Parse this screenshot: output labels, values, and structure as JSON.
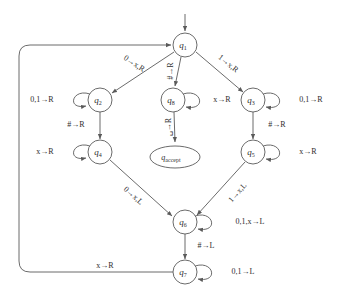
{
  "diagram": {
    "kind": "turing-machine-state-diagram",
    "background_color": "#ffffff",
    "stroke_color": "#5a5a5a",
    "text_color": "#2e2e2e",
    "states": [
      {
        "id": "q1",
        "base": "q",
        "sub": "1",
        "shape": "circle",
        "cx": 185,
        "cy": 45,
        "r": 12
      },
      {
        "id": "q2",
        "base": "q",
        "sub": "2",
        "shape": "circle",
        "cx": 100,
        "cy": 100,
        "r": 12
      },
      {
        "id": "q8",
        "base": "q",
        "sub": "8",
        "shape": "circle",
        "cx": 173,
        "cy": 100,
        "r": 12
      },
      {
        "id": "q3",
        "base": "q",
        "sub": "3",
        "shape": "circle",
        "cx": 253,
        "cy": 100,
        "r": 12
      },
      {
        "id": "q4",
        "base": "q",
        "sub": "4",
        "shape": "circle",
        "cx": 100,
        "cy": 152,
        "r": 12
      },
      {
        "id": "q5",
        "base": "q",
        "sub": "5",
        "shape": "circle",
        "cx": 253,
        "cy": 152,
        "r": 12
      },
      {
        "id": "qaccept",
        "base": "q",
        "sub": "accept",
        "shape": "ellipse",
        "cx": 175,
        "cy": 157,
        "rx": 25,
        "ry": 11
      },
      {
        "id": "q6",
        "base": "q",
        "sub": "6",
        "shape": "circle",
        "cx": 185,
        "cy": 222,
        "r": 12
      },
      {
        "id": "q7",
        "base": "q",
        "sub": "7",
        "shape": "circle",
        "cx": 185,
        "cy": 272,
        "r": 12
      }
    ],
    "start_state": "q1",
    "accept_state": "qaccept",
    "transitions": [
      {
        "from": "start",
        "to": "q1",
        "label": ""
      },
      {
        "from": "q1",
        "to": "q2",
        "label": "0→x,R"
      },
      {
        "from": "q1",
        "to": "q8",
        "label": "#→R"
      },
      {
        "from": "q1",
        "to": "q3",
        "label": "1→x,R"
      },
      {
        "from": "q2",
        "to": "q2",
        "label": "0,1→R"
      },
      {
        "from": "q8",
        "to": "q8",
        "label": "x→R"
      },
      {
        "from": "q3",
        "to": "q3",
        "label": "0,1→R"
      },
      {
        "from": "q8",
        "to": "qaccept",
        "label": "␣→R"
      },
      {
        "from": "q2",
        "to": "q4",
        "label": "#→R"
      },
      {
        "from": "q3",
        "to": "q5",
        "label": "#→R"
      },
      {
        "from": "q4",
        "to": "q4",
        "label": "x→R"
      },
      {
        "from": "q5",
        "to": "q5",
        "label": "x→R"
      },
      {
        "from": "q4",
        "to": "q6",
        "label": "0→x,L"
      },
      {
        "from": "q5",
        "to": "q6",
        "label": "1→x,L"
      },
      {
        "from": "q6",
        "to": "q6",
        "label": "0,1,x→L"
      },
      {
        "from": "q6",
        "to": "q7",
        "label": "#→L"
      },
      {
        "from": "q7",
        "to": "q7",
        "label": "0,1→L"
      },
      {
        "from": "q7",
        "to": "q1",
        "label": "x→R"
      }
    ],
    "labels": {
      "q1_to_q2": "0→x,R",
      "q1_to_q8": "#→R",
      "q1_to_q3": "1→x,R",
      "q2_self": "0,1→R",
      "q3_self": "0,1→R",
      "q8_self": "x→R",
      "q8_to_accept": "␣→R",
      "q2_to_q4": "#→R",
      "q3_to_q5": "#→R",
      "q4_self": "x→R",
      "q5_self": "x→R",
      "q4_to_q6": "0→x,L",
      "q5_to_q6": "1→x,L",
      "q6_self": "0,1,x→L",
      "q6_to_q7": "#→L",
      "q7_self": "0,1→L",
      "q7_to_q1": "x→R"
    },
    "state_text": {
      "q1": "q",
      "q1_sub": "1",
      "q2": "q",
      "q2_sub": "2",
      "q3": "q",
      "q3_sub": "3",
      "q4": "q",
      "q4_sub": "4",
      "q5": "q",
      "q5_sub": "5",
      "q6": "q",
      "q6_sub": "6",
      "q7": "q",
      "q7_sub": "7",
      "q8": "q",
      "q8_sub": "8",
      "qaccept": "q",
      "qaccept_sub": "accept"
    }
  }
}
